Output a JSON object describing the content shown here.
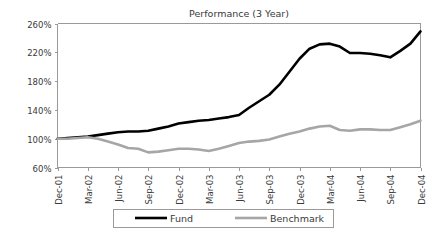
{
  "chart_data": {
    "type": "line",
    "title": "Performance (3 Year)",
    "xlabel": "",
    "ylabel": "",
    "ylim": [
      60,
      260
    ],
    "ytick_values": [
      60,
      100,
      140,
      180,
      220,
      260
    ],
    "ytick_labels": [
      "60%",
      "100%",
      "140%",
      "180%",
      "220%",
      "260%"
    ],
    "grid": false,
    "legend_position": "bottom",
    "x": [
      "Dec-01",
      "Jan-02",
      "Feb-02",
      "Mar-02",
      "Apr-02",
      "May-02",
      "Jun-02",
      "Jul-02",
      "Aug-02",
      "Sep-02",
      "Oct-02",
      "Nov-02",
      "Dec-02",
      "Jan-03",
      "Feb-03",
      "Mar-03",
      "Apr-03",
      "May-03",
      "Jun-03",
      "Jul-03",
      "Aug-03",
      "Sep-03",
      "Oct-03",
      "Nov-03",
      "Dec-03",
      "Jan-04",
      "Feb-04",
      "Mar-04",
      "Apr-04",
      "May-04",
      "Jun-04",
      "Jul-04",
      "Aug-04",
      "Sep-04",
      "Oct-04",
      "Nov-04",
      "Dec-04"
    ],
    "xtick_labels": [
      "Dec-01",
      "Mar-02",
      "Jun-02",
      "Sep-02",
      "Dec-02",
      "Mar-03",
      "Jun-03",
      "Sep-03",
      "Dec-03",
      "Mar-04",
      "Jun-04",
      "Sep-04",
      "Dec-04"
    ],
    "xtick_indices": [
      0,
      3,
      6,
      9,
      12,
      15,
      18,
      21,
      24,
      27,
      30,
      33,
      36
    ],
    "series": [
      {
        "name": "Fund",
        "color": "#000000",
        "width": 2.6,
        "values": [
          100,
          101,
          102,
          103,
          105,
          107,
          109,
          110,
          110,
          111,
          114,
          117,
          121,
          123,
          125,
          126,
          128,
          130,
          133,
          143,
          152,
          161,
          175,
          193,
          211,
          225,
          231,
          232,
          228,
          219,
          219,
          218,
          216,
          213,
          222,
          232,
          249
        ]
      },
      {
        "name": "Benchmark",
        "color": "#a6a6a6",
        "width": 2.6,
        "values": [
          100,
          100,
          101,
          102,
          100,
          96,
          92,
          87,
          86,
          81,
          82,
          84,
          86,
          86,
          85,
          83,
          86,
          90,
          94,
          96,
          97,
          99,
          103,
          107,
          110,
          114,
          117,
          118,
          112,
          111,
          113,
          113,
          112,
          112,
          116,
          120,
          125
        ]
      }
    ]
  },
  "legend": {
    "items": [
      {
        "label": "Fund"
      },
      {
        "label": "Benchmark"
      }
    ]
  },
  "colors": {
    "fund": "#000000",
    "benchmark": "#a6a6a6",
    "axis": "#9a9a9a",
    "text": "#3a3a3a",
    "background": "#ffffff"
  }
}
